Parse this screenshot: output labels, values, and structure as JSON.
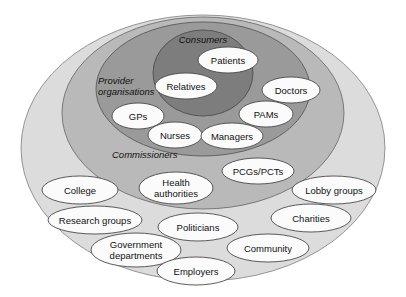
{
  "diagram": {
    "type": "nested-venn",
    "canvas": {
      "width": 406,
      "height": 297,
      "background": "#ffffff"
    },
    "rings": [
      {
        "id": "outer",
        "label": "",
        "fill": "#dcdcdc",
        "stroke": "#8a8a8a",
        "cx": 203,
        "cy": 148,
        "rx": 182,
        "ry": 133
      },
      {
        "id": "commissioners",
        "label": "Commissioners",
        "label_x": 112,
        "label_y": 158,
        "fill": "#b9b9b9",
        "stroke": "#6f6f6f",
        "cx": 203,
        "cy": 113,
        "rx": 141,
        "ry": 96
      },
      {
        "id": "provider-organisations",
        "label": "Provider organisations",
        "label_line1": "Provider",
        "label_line2": "organisations",
        "label_x": 98,
        "label_y": 84,
        "fill": "#9a9a9a",
        "stroke": "#5a5a5a",
        "cx": 203,
        "cy": 89,
        "rx": 107,
        "ry": 67
      },
      {
        "id": "consumers",
        "label": "Consumers",
        "label_x": 203,
        "label_y": 43,
        "fill": "#7d7d7d",
        "stroke": "#4e4e4e",
        "cx": 203,
        "cy": 73,
        "rx": 50,
        "ry": 43
      }
    ],
    "nodes": [
      {
        "id": "patients",
        "label": "Patients",
        "ring": "consumers",
        "cx": 228,
        "cy": 60,
        "rx": 30,
        "ry": 13,
        "lines": 1
      },
      {
        "id": "relatives",
        "label": "Relatives",
        "ring": "consumers",
        "cx": 186,
        "cy": 86,
        "rx": 31,
        "ry": 13,
        "lines": 1
      },
      {
        "id": "doctors",
        "label": "Doctors",
        "ring": "provider-organisations",
        "cx": 291,
        "cy": 90,
        "rx": 29,
        "ry": 13,
        "lines": 1
      },
      {
        "id": "gps",
        "label": "GPs",
        "ring": "provider-organisations",
        "cx": 138,
        "cy": 116,
        "rx": 26,
        "ry": 13,
        "lines": 1
      },
      {
        "id": "pams",
        "label": "PAMs",
        "ring": "provider-organisations",
        "cx": 266,
        "cy": 114,
        "rx": 27,
        "ry": 13,
        "lines": 1
      },
      {
        "id": "nurses",
        "label": "Nurses",
        "ring": "provider-organisations",
        "cx": 175,
        "cy": 135,
        "rx": 27,
        "ry": 13,
        "lines": 1
      },
      {
        "id": "managers",
        "label": "Managers",
        "ring": "provider-organisations",
        "cx": 232,
        "cy": 136,
        "rx": 31,
        "ry": 13,
        "lines": 1
      },
      {
        "id": "pcgs-pcts",
        "label": "PCGs/PCTs",
        "ring": "commissioners",
        "cx": 258,
        "cy": 171,
        "rx": 36,
        "ry": 13,
        "lines": 1
      },
      {
        "id": "health-authorities",
        "label": "Health authorities",
        "label_line1": "Health",
        "label_line2": "authorities",
        "ring": "commissioners",
        "cx": 176,
        "cy": 188,
        "rx": 37,
        "ry": 16,
        "lines": 2
      },
      {
        "id": "college",
        "label": "College",
        "ring": "outer",
        "cx": 80,
        "cy": 190,
        "rx": 38,
        "ry": 14,
        "lines": 1
      },
      {
        "id": "lobby-groups",
        "label": "Lobby groups",
        "ring": "outer",
        "cx": 334,
        "cy": 190,
        "rx": 42,
        "ry": 14,
        "lines": 1
      },
      {
        "id": "research-groups",
        "label": "Research groups",
        "ring": "outer",
        "cx": 95,
        "cy": 220,
        "rx": 47,
        "ry": 14,
        "lines": 1
      },
      {
        "id": "charities",
        "label": "Charities",
        "ring": "outer",
        "cx": 311,
        "cy": 218,
        "rx": 40,
        "ry": 14,
        "lines": 1
      },
      {
        "id": "politicians",
        "label": "Politicians",
        "ring": "outer",
        "cx": 198,
        "cy": 227,
        "rx": 40,
        "ry": 14,
        "lines": 1
      },
      {
        "id": "government-departments",
        "label": "Government departments",
        "label_line1": "Government",
        "label_line2": "departments",
        "ring": "outer",
        "cx": 136,
        "cy": 250,
        "rx": 45,
        "ry": 17,
        "lines": 2
      },
      {
        "id": "community",
        "label": "Community",
        "ring": "outer",
        "cx": 268,
        "cy": 248,
        "rx": 41,
        "ry": 14,
        "lines": 1
      },
      {
        "id": "employers",
        "label": "Employers",
        "ring": "outer",
        "cx": 196,
        "cy": 271,
        "rx": 39,
        "ry": 14,
        "lines": 1
      }
    ],
    "colors": {
      "ring_outer": "#dcdcdc",
      "ring_commissioners": "#b9b9b9",
      "ring_provider": "#9a9a9a",
      "ring_consumers": "#7d7d7d",
      "node_fill": "#fbfbfb",
      "node_stroke": "#4a4a4a",
      "text": "#111111"
    }
  }
}
